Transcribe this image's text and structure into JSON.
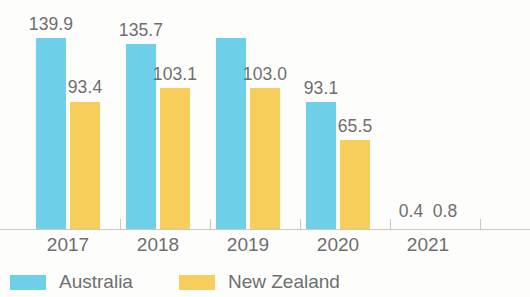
{
  "chart_data": {
    "type": "bar",
    "title": "",
    "subtitle": "",
    "xlabel": "",
    "ylabel": "",
    "categories": [
      "2017",
      "2018",
      "2019",
      "2020",
      "2021"
    ],
    "series": [
      {
        "name": "Australia",
        "color": "#6ecfe8",
        "values": [
          139.9,
          135.7,
          140.0,
          93.1,
          0.4
        ],
        "labels": [
          "139.9",
          "135.7",
          "",
          "93.1",
          "0.4"
        ],
        "label_notes": [
          "",
          "",
          "value label cropped above top edge of image",
          "",
          "shown beside New Zealand label; bar not visible at this scale"
        ]
      },
      {
        "name": "New Zealand",
        "color": "#f7ce5b",
        "values": [
          93.4,
          103.1,
          103.0,
          65.5,
          0.8
        ],
        "labels": [
          "93.4",
          "103.1",
          "103.0",
          "65.5",
          "0.8"
        ],
        "label_notes": [
          "",
          "",
          "",
          "",
          "bar not visible at this scale"
        ]
      }
    ],
    "ylim": [
      0,
      160
    ],
    "grid": false,
    "legend_position": "bottom-left",
    "axis_color": "#c9c9c4",
    "text_color": "#6e6e6e"
  },
  "legend": {
    "items": [
      {
        "label": "Australia",
        "swatch": "au"
      },
      {
        "label": "New Zealand",
        "swatch": "nz"
      }
    ]
  }
}
